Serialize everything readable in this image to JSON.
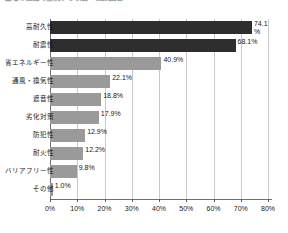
{
  "chart_data": {
    "type": "bar",
    "orientation": "horizontal",
    "title": "住宅の性能で重視する項目（複数回答）",
    "xlabel": "",
    "ylabel": "",
    "xlim": [
      0,
      80
    ],
    "xticks": [
      "0%",
      "10%",
      "20%",
      "30%",
      "40%",
      "50%",
      "60%",
      "70%",
      "80%"
    ],
    "xtick_values": [
      0,
      10,
      20,
      30,
      40,
      50,
      60,
      70,
      80
    ],
    "grid": true,
    "legend": "none",
    "categories": [
      "高耐久性",
      "耐震性",
      "省エネルギー性",
      "通風・換気性",
      "遮音性",
      "劣化対策",
      "防犯性",
      "耐火性",
      "バリアフリー性",
      "その他"
    ],
    "values": [
      74.1,
      68.1,
      40.9,
      22.1,
      18.8,
      17.9,
      12.9,
      12.2,
      9.8,
      1.0
    ],
    "value_labels": [
      "74.1\n%",
      "68.1%",
      "40.9%",
      "22.1%",
      "18.8%",
      "17.9%",
      "12.9%",
      "12.2%",
      "9.8%",
      "1.0%"
    ],
    "bar_colors": [
      "#2e2e2e",
      "#2e2e2e",
      "#9a9a9a",
      "#9a9a9a",
      "#9a9a9a",
      "#9a9a9a",
      "#9a9a9a",
      "#9a9a9a",
      "#9a9a9a",
      "#9a9a9a"
    ],
    "highlight_color": "#2e2e2e",
    "base_color": "#9a9a9a",
    "gridline_color": "#c8c8c8",
    "axis_color": "#6e6e6e"
  }
}
